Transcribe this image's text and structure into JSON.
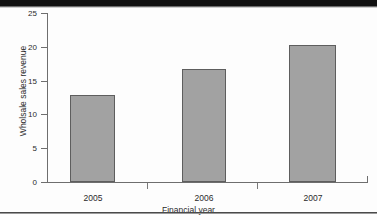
{
  "page": {
    "background_color": "#fdfdfd",
    "scan_band_color": "#111111",
    "rule_color": "#4a4a4a"
  },
  "chart_data": {
    "type": "bar",
    "title": "",
    "xlabel": "Financial year",
    "ylabel": "Wholsale sales revenue",
    "categories": [
      "2005",
      "2006",
      "2007"
    ],
    "values": [
      12.8,
      16.7,
      20.3
    ],
    "series": [
      {
        "name": "Wholsale sales revenue",
        "values": [
          12.8,
          16.7,
          20.3
        ]
      }
    ],
    "ylim": [
      0,
      25
    ],
    "ytick_labels": [
      "0",
      "5",
      "10",
      "15",
      "20",
      "25"
    ],
    "ytick_values": [
      0,
      5,
      10,
      15,
      20,
      25
    ],
    "xtick_labels": [
      "2005",
      "2006",
      "2007"
    ],
    "grid": false,
    "legend": false,
    "legend_position": "none",
    "bar_fill_color": "#a2a2a2",
    "bar_edge_color": "#5e5e5e",
    "axis_color": "#6e6e6e",
    "text_color": "#2b2b2b"
  }
}
